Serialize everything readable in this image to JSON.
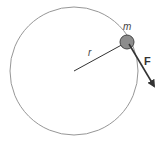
{
  "diagram": {
    "labels": {
      "mass": "m",
      "radius": "r",
      "force": "F"
    },
    "colors": {
      "circle": "#8a8a8a",
      "line": "#333333",
      "mass_fill": "#8c8c8c",
      "mass_stroke": "#444444",
      "arrow": "#333333",
      "text": "#333333"
    },
    "geometry": {
      "circle_center": [
        74,
        71
      ],
      "circle_radius": 64,
      "mass_center": [
        127,
        42
      ],
      "mass_radius": 7,
      "force_start": [
        130,
        44
      ],
      "force_end": [
        155,
        88
      ]
    }
  }
}
